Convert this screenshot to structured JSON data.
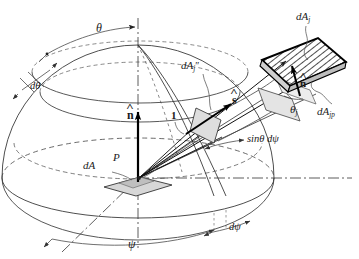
{
  "figure": {
    "type": "technical-line-diagram",
    "background_color": "#ffffff",
    "line_color": "#333333",
    "fill_color": "#d9d9d9",
    "hatch_color": "#000000"
  },
  "labels": {
    "theta": "θ",
    "d_theta": "dθ",
    "psi": "ψ",
    "d_psi": "dψ",
    "unit_radius": "1",
    "point_p": "P",
    "dA": "dA",
    "dA_j": "dA",
    "dA_j_sub": "j",
    "dA_j_doubleprime": "dA",
    "dA_j_doubleprime_sub": "j",
    "dA_j_doubleprime_marks": "″",
    "dA_jp": "dA",
    "dA_jp_sub": "jp",
    "theta_j": "θ",
    "theta_j_sub": "j",
    "n_hat_origin": "n",
    "n_hat_surface": "n",
    "s_hat": "s",
    "sin_theta_dpsi": "sinθ dψ"
  },
  "geometry": {
    "origin": {
      "x": 138,
      "y": 178
    },
    "hemisphere_radius_x": 138,
    "hemisphere_radius_y": 118,
    "base_ellipse_ry": 38,
    "patch_center": {
      "x": 292,
      "y": 70
    }
  }
}
